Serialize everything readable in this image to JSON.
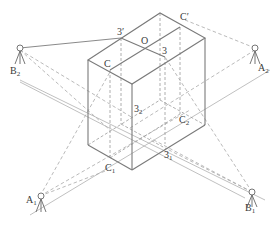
{
  "figure": {
    "colors": {
      "line": "#8a8a8a",
      "dashed": "#a8a8a8",
      "text": "#3a3a3a",
      "background": "#ffffff"
    }
  },
  "labels": {
    "three_prime": "3′",
    "o": "O",
    "c_prime": "C′",
    "three": "3",
    "c": "C",
    "three_2": {
      "base": "3",
      "sub": "2"
    },
    "c_2": {
      "base": "C",
      "sub": "2"
    },
    "three_1": {
      "base": "3",
      "sub": "1"
    },
    "c_1": {
      "base": "C",
      "sub": "1"
    }
  },
  "instruments": [
    {
      "id": "B2",
      "base": "B",
      "sub": "2",
      "icon": "tripod-theodolite-icon"
    },
    {
      "id": "A2",
      "base": "A",
      "sub": "2",
      "icon": "tripod-theodolite-icon"
    },
    {
      "id": "A1",
      "base": "A",
      "sub": "1",
      "icon": "tripod-theodolite-icon"
    },
    {
      "id": "B1",
      "base": "B",
      "sub": "1",
      "icon": "tripod-theodolite-icon"
    }
  ]
}
